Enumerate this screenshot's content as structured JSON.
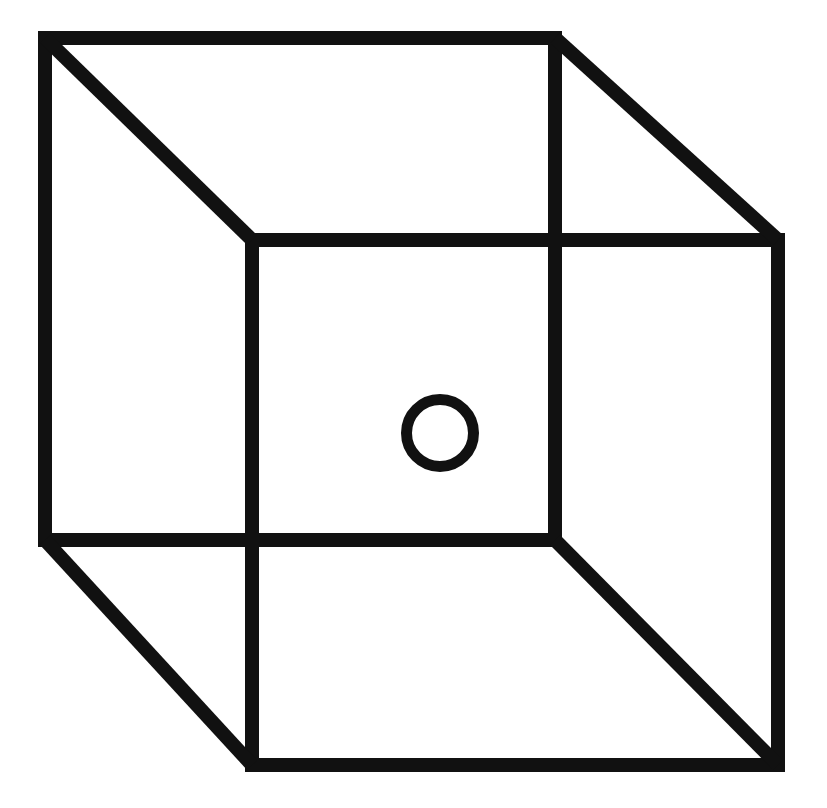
{
  "figure": {
    "name": "necker-cube-with-circle",
    "title": "Necker cube wireframe with small circle marker",
    "canvas": {
      "width": 827,
      "height": 808,
      "background": "#ffffff"
    },
    "stroke": {
      "color": "#111111",
      "width": 14,
      "linejoin": "miter",
      "linecap": "butt"
    },
    "cube": {
      "description": "Two overlapping squares joined at the corners by four diagonals, forming an ambiguous Necker cube.",
      "square_back": {
        "label": "upper-left square",
        "points": [
          {
            "name": "back-top-left",
            "x": 45,
            "y": 38
          },
          {
            "name": "back-top-right",
            "x": 555,
            "y": 38
          },
          {
            "name": "back-bottom-right",
            "x": 555,
            "y": 540
          },
          {
            "name": "back-bottom-left",
            "x": 45,
            "y": 540
          }
        ]
      },
      "square_front": {
        "label": "lower-right square",
        "points": [
          {
            "name": "front-top-left",
            "x": 252,
            "y": 240
          },
          {
            "name": "front-top-right",
            "x": 778,
            "y": 240
          },
          {
            "name": "front-bottom-right",
            "x": 778,
            "y": 765
          },
          {
            "name": "front-bottom-left",
            "x": 252,
            "y": 765
          }
        ]
      },
      "connectors": [
        {
          "name": "diagonal-top-left",
          "x1": 45,
          "y1": 38,
          "x2": 252,
          "y2": 240
        },
        {
          "name": "diagonal-top-right",
          "x1": 555,
          "y1": 38,
          "x2": 778,
          "y2": 240
        },
        {
          "name": "diagonal-bottom-right",
          "x1": 555,
          "y1": 540,
          "x2": 778,
          "y2": 765
        },
        {
          "name": "diagonal-bottom-left",
          "x1": 45,
          "y1": 540,
          "x2": 252,
          "y2": 765
        }
      ]
    },
    "circle": {
      "name": "circle-marker",
      "cx": 440,
      "cy": 433,
      "outer_radius": 39,
      "stroke_width": 11,
      "fill": "none",
      "stroke_color": "#111111"
    }
  }
}
